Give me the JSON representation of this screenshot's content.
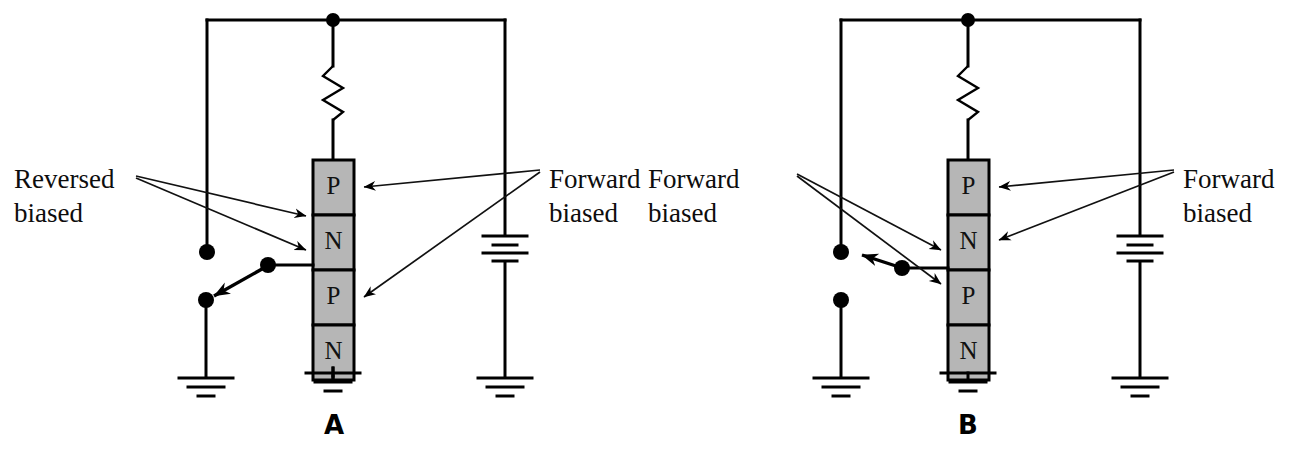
{
  "figure": {
    "background_color": "#ffffff",
    "line_color": "#000000",
    "layer_fill_color": "#b6b6b6"
  },
  "panels": [
    {
      "id": "A",
      "label": "A",
      "device": {
        "name": "pnpn-stack",
        "layers": [
          {
            "symbol": "P"
          },
          {
            "symbol": "N"
          },
          {
            "symbol": "P"
          },
          {
            "symbol": "N"
          }
        ]
      },
      "components": {
        "resistor": "resistor-symbol",
        "battery": "battery-symbol",
        "grounds": 3
      },
      "callouts": [
        {
          "name": "left-callout",
          "line1": "Reversed",
          "line2": "biased",
          "targets": [
            "N",
            "P"
          ]
        },
        {
          "name": "right-callout",
          "line1": "Forward",
          "line2": "biased",
          "targets": [
            "P",
            "N"
          ]
        }
      ]
    },
    {
      "id": "B",
      "label": "B",
      "device": {
        "name": "pnpn-stack",
        "layers": [
          {
            "symbol": "P"
          },
          {
            "symbol": "N"
          },
          {
            "symbol": "P"
          },
          {
            "symbol": "N"
          }
        ]
      },
      "components": {
        "resistor": "resistor-symbol",
        "battery": "battery-symbol",
        "grounds": 3
      },
      "callouts": [
        {
          "name": "left-callout",
          "line1": "Forward",
          "line2": "biased",
          "targets": [
            "N",
            "P"
          ]
        },
        {
          "name": "right-callout",
          "line1": "Forward",
          "line2": "biased",
          "targets": [
            "P",
            "N"
          ]
        }
      ]
    }
  ]
}
